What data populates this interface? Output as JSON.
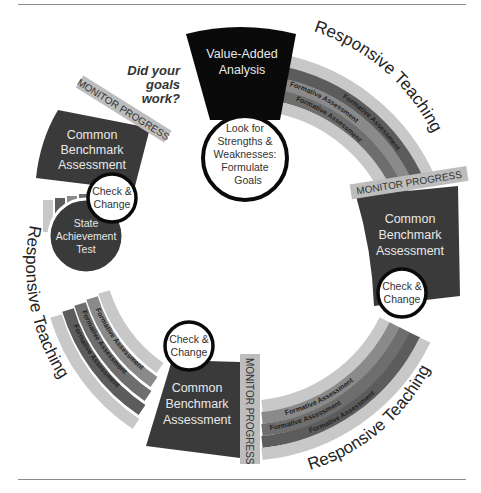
{
  "diagram": {
    "title_question": [
      "Did your",
      "goals",
      "work?"
    ],
    "top_block": {
      "label": [
        "Value-Added",
        "Analysis"
      ],
      "circle": [
        "Look for",
        "Strengths &",
        "Weaknesses:",
        "Formulate",
        "Goals"
      ]
    },
    "benchmark_blocks": [
      {
        "position": "left",
        "label": [
          "Common",
          "Benchmark",
          "Assessment"
        ],
        "monitor": "MONITOR PROGRESS",
        "check": [
          "Check &",
          "Change"
        ]
      },
      {
        "position": "right",
        "label": [
          "Common",
          "Benchmark",
          "Assessment"
        ],
        "monitor": "MONITOR PROGRESS",
        "check": [
          "Check &",
          "Change"
        ]
      },
      {
        "position": "bottom",
        "label": [
          "Common",
          "Benchmark",
          "Assessment"
        ],
        "monitor": "MONITOR PROGRESS",
        "check": [
          "Check &",
          "Change"
        ]
      }
    ],
    "state_test": [
      "State",
      "Achievement",
      "Test"
    ],
    "responsive_teaching": "Responsive Teaching",
    "formative_assessment": "Formative Assessment",
    "colors": {
      "dark_block": "#3a3a3a",
      "black_block": "#0a0a0a",
      "band_light": "#c4c4c4",
      "band_mid": "#8e8e8e",
      "band_dark": "#5a5a5a",
      "monitor_tab": "#bdbdbd"
    }
  }
}
